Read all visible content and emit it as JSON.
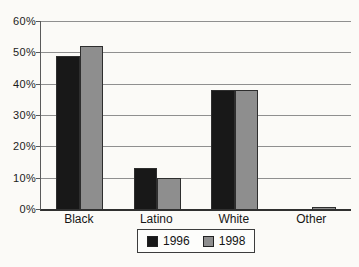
{
  "chart_data": {
    "type": "bar",
    "title": "",
    "xlabel": "",
    "ylabel": "",
    "categories": [
      "Black",
      "Latino",
      "White",
      "Other"
    ],
    "series": [
      {
        "name": "1996",
        "color": "#181818",
        "values": [
          49,
          13,
          38,
          0
        ]
      },
      {
        "name": "1998",
        "color": "#8e8e8e",
        "values": [
          52,
          10,
          38,
          0.5
        ]
      }
    ],
    "ylim": [
      0,
      60
    ],
    "ytick_step": 10,
    "ytick_labels": [
      "0%",
      "10%",
      "20%",
      "30%",
      "40%",
      "50%",
      "60%"
    ],
    "grid": true,
    "legend_position": "bottom-center"
  },
  "colors": {
    "grid": "#8f8f8f",
    "tick": "#5a5a5a",
    "axis": "#303030",
    "text": "#1c1c1c",
    "background": "#fbfaf7"
  }
}
